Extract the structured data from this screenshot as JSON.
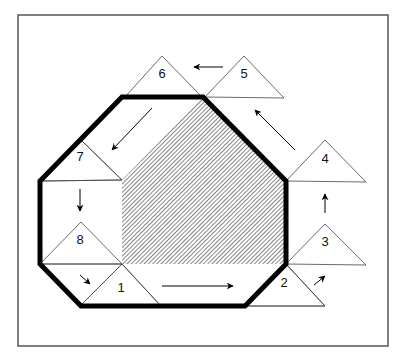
{
  "diagram": {
    "type": "octagon-traversal",
    "frame": {
      "x": 18,
      "y": 15,
      "width": 370,
      "height": 331,
      "stroke": "#555555"
    },
    "octagon": {
      "points": [
        [
          122,
          97
        ],
        [
          203,
          97
        ],
        [
          286,
          181
        ],
        [
          286,
          264
        ],
        [
          245,
          306
        ],
        [
          81,
          306
        ],
        [
          40,
          264
        ],
        [
          40,
          181
        ]
      ],
      "stroke": "#000000",
      "stroke_width": 5
    },
    "hatched_region": {
      "points": [
        [
          203,
          97
        ],
        [
          286,
          181
        ],
        [
          286,
          264
        ],
        [
          122,
          264
        ],
        [
          122,
          180
        ]
      ],
      "hatch_color": "#333333"
    },
    "inner_lines": [
      [
        [
          40,
          181
        ],
        [
          122,
          180
        ]
      ],
      [
        [
          122,
          180
        ],
        [
          81,
          140
        ]
      ],
      [
        [
          40,
          264
        ],
        [
          122,
          264
        ]
      ],
      [
        [
          122,
          264
        ],
        [
          81,
          305
        ]
      ],
      [
        [
          122,
          264
        ],
        [
          160,
          305
        ]
      ],
      [
        [
          286,
          264
        ],
        [
          325,
          306
        ]
      ],
      [
        [
          245,
          306
        ],
        [
          325,
          306
        ]
      ]
    ],
    "triangles": [
      {
        "id": 1,
        "label": "1",
        "points": [
          [
            122,
            264
          ],
          [
            81,
            305
          ],
          [
            160,
            305
          ]
        ],
        "label_pos": [
          121,
          289
        ]
      },
      {
        "id": 2,
        "label": "2",
        "points": [
          [
            286,
            264
          ],
          [
            245,
            306
          ],
          [
            325,
            306
          ]
        ],
        "label_pos": [
          284,
          284
        ]
      },
      {
        "id": 3,
        "label": "3",
        "points": [
          [
            325,
            224
          ],
          [
            286,
            264
          ],
          [
            366,
            265
          ]
        ],
        "label_pos": [
          325,
          243
        ]
      },
      {
        "id": 4,
        "label": "4",
        "points": [
          [
            325,
            140
          ],
          [
            286,
            181
          ],
          [
            366,
            182
          ]
        ],
        "label_pos": [
          325,
          160
        ]
      },
      {
        "id": 5,
        "label": "5",
        "points": [
          [
            244,
            56
          ],
          [
            205,
            97
          ],
          [
            284,
            98
          ]
        ],
        "label_pos": [
          244,
          75
        ]
      },
      {
        "id": 6,
        "label": "6",
        "points": [
          [
            162,
            56
          ],
          [
            125,
            97
          ],
          [
            202,
            97
          ]
        ],
        "label_pos": [
          162,
          75
        ]
      },
      {
        "id": 7,
        "label": "7",
        "points": [
          [
            81,
            140
          ],
          [
            40,
            181
          ],
          [
            122,
            180
          ]
        ],
        "label_pos": [
          80,
          158
        ]
      },
      {
        "id": 8,
        "label": "8",
        "points": [
          [
            81,
            222
          ],
          [
            40,
            264
          ],
          [
            122,
            264
          ]
        ],
        "label_pos": [
          80,
          241
        ]
      }
    ],
    "arrows": [
      {
        "name": "arrow-1-to-2",
        "from": [
          162,
          286
        ],
        "to": [
          233,
          286
        ]
      },
      {
        "name": "arrow-2-to-3",
        "from": [
          314,
          285
        ],
        "to": [
          325,
          276
        ]
      },
      {
        "name": "arrow-3-to-4",
        "from": [
          325,
          213
        ],
        "to": [
          325,
          194
        ]
      },
      {
        "name": "arrow-4-to-5",
        "from": [
          295,
          150
        ],
        "to": [
          255,
          110
        ]
      },
      {
        "name": "arrow-5-to-6",
        "from": [
          223,
          67
        ],
        "to": [
          194,
          67
        ]
      },
      {
        "name": "arrow-6-to-7",
        "from": [
          152,
          108
        ],
        "to": [
          112,
          150
        ]
      },
      {
        "name": "arrow-7-to-8",
        "from": [
          80,
          189
        ],
        "to": [
          80,
          211
        ]
      },
      {
        "name": "arrow-8-to-1",
        "from": [
          80,
          275
        ],
        "to": [
          90,
          284
        ]
      }
    ]
  }
}
